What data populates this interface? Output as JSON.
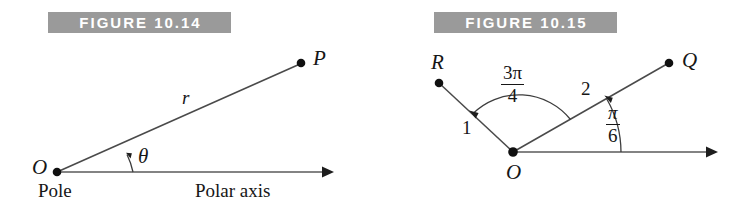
{
  "page": {
    "background": "#ffffff",
    "ink": "#161616",
    "banner_fill": "#9a9a9a",
    "banner_text_color": "#ffffff"
  },
  "figures": [
    {
      "id": "figure-10-14",
      "banner_label": "FIGURE 10.14",
      "caption_pole": "Pole",
      "caption_axis": "Polar axis",
      "points": [
        {
          "name": "origin",
          "label": "O"
        },
        {
          "name": "point-p",
          "label": "P"
        }
      ],
      "segment_labels": [
        {
          "name": "radius",
          "label": "r"
        }
      ],
      "angle_labels": [
        {
          "name": "theta",
          "label": "θ"
        }
      ]
    },
    {
      "id": "figure-10-15",
      "banner_label": "FIGURE 10.15",
      "points": [
        {
          "name": "origin",
          "label": "O"
        },
        {
          "name": "point-q",
          "label": "Q"
        },
        {
          "name": "point-r",
          "label": "R"
        }
      ],
      "segment_labels": [
        {
          "name": "length-oq",
          "label": "2"
        },
        {
          "name": "length-or",
          "label": "1"
        }
      ],
      "angle_labels": [
        {
          "name": "angle-pi-over-6",
          "numerator": "π",
          "denominator": "6"
        },
        {
          "name": "angle-3pi-over-4",
          "numerator": "3π",
          "denominator": "4"
        }
      ]
    }
  ]
}
